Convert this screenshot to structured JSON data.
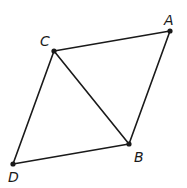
{
  "diagram": {
    "type": "parallelogram-with-diagonal",
    "vertices": {
      "A": {
        "label": "A",
        "x": 170,
        "y": 31,
        "label_x": 164,
        "label_y": 25
      },
      "B": {
        "label": "B",
        "x": 129,
        "y": 144,
        "label_x": 134,
        "label_y": 162
      },
      "C": {
        "label": "C",
        "x": 54,
        "y": 51,
        "label_x": 40,
        "label_y": 46
      },
      "D": {
        "label": "D",
        "x": 13,
        "y": 164,
        "label_x": 8,
        "label_y": 182
      }
    },
    "edges": [
      {
        "from": "C",
        "to": "A"
      },
      {
        "from": "A",
        "to": "B"
      },
      {
        "from": "B",
        "to": "D"
      },
      {
        "from": "D",
        "to": "C"
      },
      {
        "from": "C",
        "to": "B"
      }
    ],
    "colors": {
      "stroke": "#1a1a1a",
      "background": "#ffffff"
    }
  }
}
